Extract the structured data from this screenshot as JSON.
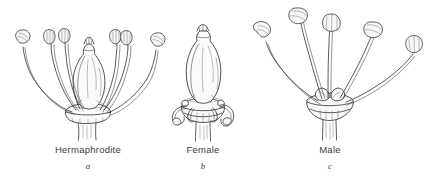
{
  "figure": {
    "style": "pen-and-ink botanical line drawing",
    "background_color": "#ffffff",
    "ink_color": "#262626",
    "panels": [
      {
        "id": "a",
        "name": "Hermaphrodite",
        "letter": "a",
        "label_x": 88,
        "label_y": 144,
        "description": "Flask-shaped ovary with style and stigma at centre, surrounded by six outward-curving stamens with oval anthers, on a swollen receptacle and pedicel",
        "parts": {
          "ovary": "pear-shaped superior ovary, stippled",
          "style": "short narrow neck above ovary",
          "stigma": "lobed tip",
          "stamen_count": 6,
          "receptacle": "swollen collar at base",
          "pedicel": "tapering stalk below receptacle"
        }
      },
      {
        "id": "b",
        "name": "Female",
        "letter": "b",
        "label_x": 203,
        "label_y": 144,
        "description": "Large flask-shaped ovary with stigma; stamens reduced to small curled staminodes at the base; no functional anthers raised above the flower",
        "parts": {
          "ovary": "large pear-shaped ovary, stippled",
          "style": "narrow neck",
          "stigma": "lobed tip",
          "staminode_count": 4,
          "receptacle": "collar of rounded lobes",
          "pedicel": "short stout stalk"
        }
      },
      {
        "id": "c",
        "name": "Male",
        "letter": "c",
        "label_x": 330,
        "label_y": 144,
        "description": "Five long stamens with large oval anthers radiating from a small rudimentary ovary on a funnel-shaped receptacle; no developed pistil",
        "parts": {
          "stamen_count": 5,
          "rudimentary_ovary": "small knob at centre",
          "receptacle": "funnel-shaped collar",
          "pedicel": "tapering stalk"
        }
      }
    ]
  }
}
